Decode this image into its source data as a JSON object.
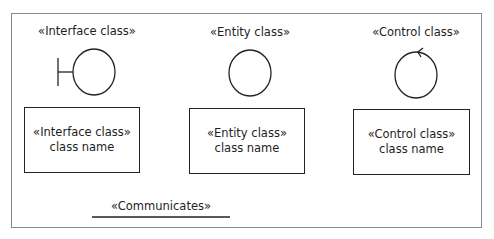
{
  "diagram": {
    "columns": [
      {
        "id": "interface",
        "heading": "«Interface class»",
        "icon": "boundary-icon",
        "box_stereotype": "«Interface class»",
        "box_name": "class name"
      },
      {
        "id": "entity",
        "heading": "«Entity class»",
        "icon": "entity-icon",
        "box_stereotype": "«Entity class»",
        "box_name": "class name"
      },
      {
        "id": "control",
        "heading": "«Control class»",
        "icon": "control-icon",
        "box_stereotype": "«Control class»",
        "box_name": "class name"
      }
    ],
    "association": {
      "label": "«Communicates»"
    }
  },
  "colors": {
    "stroke": "#222222",
    "frame": "#8a8a8a",
    "text": "#1e1e1e"
  }
}
